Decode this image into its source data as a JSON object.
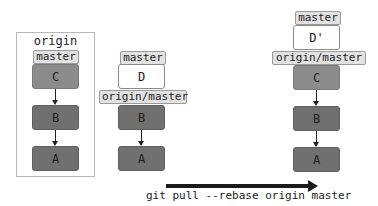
{
  "origin_repo": {
    "title": "origin",
    "branch_label": "master",
    "commits": [
      "C",
      "B",
      "A"
    ]
  },
  "local_before": {
    "branch_label": "master",
    "remote_label": "origin/master",
    "commits": [
      "D",
      "B",
      "A"
    ]
  },
  "local_after": {
    "branch_label": "master",
    "remote_label": "origin/master",
    "commits": [
      "D'",
      "C",
      "B",
      "A"
    ]
  },
  "command": "git pull --rebase origin master",
  "colors": {
    "commit_light": "#8c8c8c",
    "commit_dark": "#707070",
    "commit_new": "#ffffff",
    "label_bg": "#e2e2e2",
    "arrow": "#1a1a1a"
  }
}
